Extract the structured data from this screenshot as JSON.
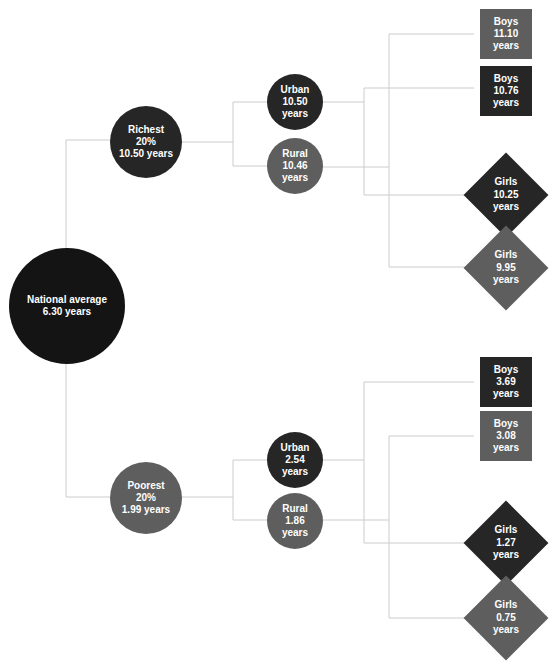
{
  "colors": {
    "dark": "#262626",
    "mid": "#5e5e5e",
    "black": "#141414",
    "line": "#cccccc"
  },
  "root": {
    "label": "National average",
    "value": "6.30 years"
  },
  "richest": {
    "label": "Richest",
    "share": "20%",
    "value": "10.50 years",
    "urban": {
      "label": "Urban",
      "value": "10.50",
      "unit": "years"
    },
    "rural": {
      "label": "Rural",
      "value": "10.46",
      "unit": "years"
    },
    "boys_urban": {
      "label": "Boys",
      "value": "11.10",
      "unit": "years"
    },
    "boys_rural": {
      "label": "Boys",
      "value": "10.76",
      "unit": "years"
    },
    "girls_urban": {
      "label": "Girls",
      "value": "10.25",
      "unit": "years"
    },
    "girls_rural": {
      "label": "Girls",
      "value": "9.95",
      "unit": "years"
    }
  },
  "poorest": {
    "label": "Poorest",
    "share": "20%",
    "value": "1.99 years",
    "urban": {
      "label": "Urban",
      "value": "2.54",
      "unit": "years"
    },
    "rural": {
      "label": "Rural",
      "value": "1.86",
      "unit": "years"
    },
    "boys_urban": {
      "label": "Boys",
      "value": "3.69",
      "unit": "years"
    },
    "boys_rural": {
      "label": "Boys",
      "value": "3.08",
      "unit": "years"
    },
    "girls_urban": {
      "label": "Girls",
      "value": "1.27",
      "unit": "years"
    },
    "girls_rural": {
      "label": "Girls",
      "value": "0.75",
      "unit": "years"
    }
  }
}
